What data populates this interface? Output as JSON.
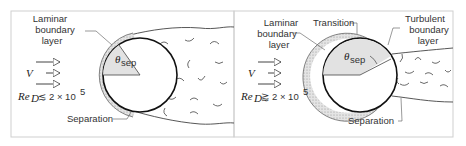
{
  "figure": {
    "panels": [
      {
        "id": "left",
        "labels": {
          "laminar_line1": "Laminar",
          "laminar_line2": "boundary",
          "laminar_line3": "layer",
          "velocity": "V",
          "theta": "θ",
          "theta_sub": "sep",
          "re": "Re",
          "re_sub": "D",
          "re_rel": "≲",
          "re_value": "2 × 10",
          "re_exp": "5",
          "separation": "Separation"
        }
      },
      {
        "id": "right",
        "labels": {
          "laminar_line1": "Laminar",
          "laminar_line2": "boundary",
          "laminar_line3": "layer",
          "transition": "Transition",
          "turbulent_line1": "Turbulent",
          "turbulent_line2": "boundary",
          "turbulent_line3": "layer",
          "velocity": "V",
          "theta": "θ",
          "theta_sub": "sep",
          "re": "Re",
          "re_sub": "D",
          "re_rel": "⪆",
          "re_value": "2 × 10",
          "re_exp": "5",
          "separation": "Separation"
        }
      }
    ]
  }
}
